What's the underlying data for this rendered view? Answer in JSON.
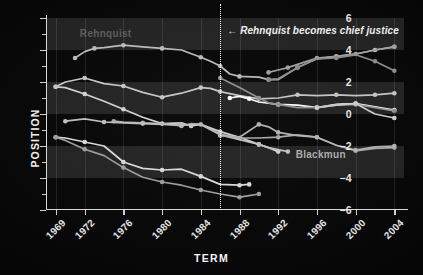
{
  "chart_data": {
    "type": "line",
    "title": "",
    "xlabel": "TERM",
    "ylabel": "POSITION",
    "xlim": [
      1968,
      2005
    ],
    "ylim": [
      -6,
      6
    ],
    "grid": true,
    "legend_position": "inline-labels",
    "x_ticks": [
      1969,
      1972,
      1976,
      1980,
      1984,
      1988,
      1992,
      1996,
      2000,
      2004
    ],
    "x_tick_labels": [
      "1969",
      "1972",
      "1976",
      "1980",
      "1984",
      "1988",
      "1992",
      "1996",
      "2000",
      "2004"
    ],
    "y_ticks": [
      6,
      4,
      2,
      0,
      -2,
      -4,
      -6
    ],
    "y_tick_labels": [
      "6",
      "4",
      "2",
      "0",
      "-2",
      "-4",
      "-6"
    ],
    "y_minor_ticks": [
      5,
      3,
      1,
      -1,
      -3,
      -5
    ],
    "shaded_bands": [
      [
        4,
        6
      ],
      [
        0,
        2
      ],
      [
        -4,
        -2
      ]
    ],
    "annotations": [
      {
        "name": "rehnquist-chief-justice",
        "text": "← Rehnquist becomes chief justice",
        "x": 1986,
        "y": 5.1,
        "marker": "vertical-dotted-line"
      }
    ],
    "series": [
      {
        "name": "Rehnquist",
        "color": "#b9b9b9",
        "label_shown": true,
        "points": [
          [
            1971,
            3.5
          ],
          [
            1972,
            3.9
          ],
          [
            1973,
            4.1
          ],
          [
            1974,
            4.15
          ],
          [
            1976,
            4.3
          ],
          [
            1978,
            4.2
          ],
          [
            1980,
            4.1
          ],
          [
            1982,
            4.0
          ],
          [
            1984,
            3.55
          ],
          [
            1985,
            3.3
          ],
          [
            1986,
            3.0
          ],
          [
            1987,
            2.5
          ],
          [
            1988,
            2.35
          ],
          [
            1990,
            2.3
          ],
          [
            1991,
            2.15
          ],
          [
            1992,
            2.15
          ],
          [
            1994,
            2.9
          ],
          [
            1996,
            3.45
          ],
          [
            1998,
            3.6
          ],
          [
            2000,
            3.75
          ],
          [
            2002,
            4.0
          ],
          [
            2004,
            4.2
          ]
        ]
      },
      {
        "name": "Scalia",
        "color": "#9e9e9e",
        "label_shown": false,
        "points": [
          [
            1991,
            2.6
          ],
          [
            1992,
            2.75
          ],
          [
            1993,
            2.9
          ],
          [
            1994,
            3.1
          ],
          [
            1996,
            3.5
          ],
          [
            1998,
            3.6
          ],
          [
            2000,
            3.75
          ],
          [
            2002,
            4.0
          ],
          [
            2004,
            4.2
          ]
        ]
      },
      {
        "name": "Thomas",
        "color": "#8a8a8a",
        "label_shown": false,
        "points": [
          [
            1991,
            2.15
          ],
          [
            1992,
            2.2
          ],
          [
            1994,
            2.9
          ],
          [
            1996,
            3.45
          ],
          [
            1998,
            3.5
          ],
          [
            2000,
            3.7
          ],
          [
            2002,
            3.3
          ],
          [
            2004,
            2.7
          ]
        ]
      },
      {
        "name": "White",
        "color": "#cfcfcf",
        "label_shown": false,
        "points": [
          [
            1969,
            1.7
          ],
          [
            1970,
            1.65
          ],
          [
            1972,
            1.25
          ],
          [
            1974,
            0.8
          ],
          [
            1976,
            0.3
          ],
          [
            1978,
            -0.2
          ],
          [
            1980,
            -0.6
          ],
          [
            1982,
            -0.55
          ],
          [
            1983,
            -0.75
          ],
          [
            1984,
            -0.65
          ],
          [
            1986,
            -1.1
          ],
          [
            1988,
            -1.45
          ],
          [
            1990,
            -1.9
          ],
          [
            1991,
            -2.1
          ],
          [
            1992,
            -2.35
          ]
        ]
      },
      {
        "name": "Powell",
        "color": "#c4c4c4",
        "label_shown": false,
        "points": [
          [
            1969,
            1.7
          ],
          [
            1970,
            2.0
          ],
          [
            1972,
            2.25
          ],
          [
            1974,
            1.9
          ],
          [
            1976,
            1.75
          ],
          [
            1978,
            1.35
          ],
          [
            1980,
            1.05
          ],
          [
            1982,
            1.3
          ],
          [
            1984,
            1.65
          ],
          [
            1985,
            1.6
          ],
          [
            1986,
            1.4
          ],
          [
            1988,
            1.15
          ],
          [
            1990,
            0.95
          ],
          [
            1992,
            1.0
          ],
          [
            1994,
            1.2
          ],
          [
            1996,
            1.15
          ],
          [
            1998,
            1.2
          ],
          [
            2000,
            1.15
          ],
          [
            2002,
            1.2
          ],
          [
            2004,
            1.3
          ]
        ]
      },
      {
        "name": "OConnor",
        "color": "#ffffff",
        "label_shown": false,
        "points": [
          [
            1987,
            1.0
          ],
          [
            1988,
            1.1
          ],
          [
            1989,
            0.95
          ],
          [
            1990,
            0.75
          ],
          [
            1992,
            0.6
          ],
          [
            1994,
            0.55
          ],
          [
            1996,
            0.4
          ],
          [
            1998,
            0.6
          ],
          [
            2000,
            0.65
          ],
          [
            2002,
            0.45
          ],
          [
            2004,
            0.25
          ]
        ]
      },
      {
        "name": "Stevens",
        "color": "#a8a8a8",
        "label_shown": false,
        "points": [
          [
            1975,
            -0.45
          ],
          [
            1976,
            -0.5
          ],
          [
            1978,
            -0.55
          ],
          [
            1980,
            -0.6
          ],
          [
            1982,
            -0.75
          ],
          [
            1983,
            -0.6
          ],
          [
            1984,
            -0.65
          ],
          [
            1986,
            -1.25
          ],
          [
            1988,
            -1.5
          ],
          [
            1990,
            -1.5
          ],
          [
            1992,
            -1.45
          ],
          [
            1994,
            -1.3
          ],
          [
            1996,
            -1.45
          ],
          [
            1998,
            -1.95
          ],
          [
            2000,
            -2.3
          ],
          [
            2002,
            -2.15
          ],
          [
            2004,
            -2.1
          ]
        ]
      },
      {
        "name": "Blackmun",
        "color": "#bdbdbd",
        "label_shown": true,
        "points": [
          [
            1970,
            -0.45
          ],
          [
            1972,
            -0.3
          ],
          [
            1974,
            -0.5
          ],
          [
            1976,
            -0.55
          ],
          [
            1978,
            -0.6
          ],
          [
            1980,
            -0.65
          ],
          [
            1982,
            -0.7
          ],
          [
            1984,
            -0.65
          ],
          [
            1986,
            -1.3
          ],
          [
            1988,
            -1.6
          ],
          [
            1990,
            -1.9
          ],
          [
            1991,
            -2.1
          ],
          [
            1993,
            -2.35
          ]
        ]
      },
      {
        "name": "Brennan",
        "color": "#d8d8d8",
        "label_shown": false,
        "points": [
          [
            1969,
            -1.45
          ],
          [
            1970,
            -1.5
          ],
          [
            1972,
            -1.75
          ],
          [
            1974,
            -2.0
          ],
          [
            1976,
            -3.0
          ],
          [
            1978,
            -3.4
          ],
          [
            1980,
            -3.5
          ],
          [
            1982,
            -3.45
          ],
          [
            1984,
            -3.9
          ],
          [
            1986,
            -4.4
          ],
          [
            1988,
            -4.45
          ],
          [
            1989,
            -4.4
          ]
        ]
      },
      {
        "name": "Marshall",
        "color": "#9c9c9c",
        "label_shown": false,
        "points": [
          [
            1969,
            -1.45
          ],
          [
            1970,
            -1.65
          ],
          [
            1972,
            -2.2
          ],
          [
            1974,
            -2.6
          ],
          [
            1976,
            -3.35
          ],
          [
            1978,
            -3.95
          ],
          [
            1980,
            -4.25
          ],
          [
            1982,
            -4.45
          ],
          [
            1984,
            -4.75
          ],
          [
            1986,
            -5.0
          ],
          [
            1988,
            -5.2
          ],
          [
            1989,
            -5.1
          ],
          [
            1990,
            -5.0
          ]
        ]
      },
      {
        "name": "Souter",
        "color": "#b0b0b0",
        "label_shown": false,
        "points": [
          [
            1986,
            -1.35
          ],
          [
            1988,
            -1.45
          ],
          [
            1990,
            -0.65
          ],
          [
            1991,
            -0.8
          ],
          [
            1992,
            -1.15
          ],
          [
            1994,
            -1.35
          ],
          [
            1996,
            -1.45
          ],
          [
            1998,
            -1.95
          ],
          [
            2000,
            -2.25
          ],
          [
            2002,
            -2.05
          ],
          [
            2004,
            -2.0
          ]
        ]
      },
      {
        "name": "Ginsburg",
        "color": "#8f8f8f",
        "label_shown": false,
        "points": [
          [
            1986,
            2.25
          ],
          [
            1988,
            1.65
          ],
          [
            1990,
            1.0
          ],
          [
            1991,
            0.7
          ],
          [
            1992,
            0.6
          ],
          [
            1994,
            0.4
          ],
          [
            1996,
            0.4
          ],
          [
            1998,
            0.55
          ],
          [
            2000,
            0.6
          ],
          [
            2002,
            0.4
          ],
          [
            2004,
            0.2
          ]
        ]
      },
      {
        "name": "Breyer",
        "color": "#c9c9c9",
        "label_shown": false,
        "points": [
          [
            1996,
            0.4
          ],
          [
            1998,
            0.55
          ],
          [
            2000,
            0.65
          ],
          [
            2002,
            0.0
          ],
          [
            2004,
            -0.25
          ]
        ]
      }
    ]
  },
  "labels": {
    "rehnquist_inline": "Rehnquist",
    "blackmun_inline": "Blackmun",
    "annotation": "← Rehnquist becomes chief justice"
  }
}
